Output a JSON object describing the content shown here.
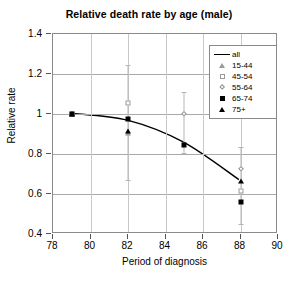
{
  "chart_data": {
    "type": "scatter",
    "title": "Relative death rate by age (male)",
    "xlabel": "Period of diagnosis",
    "ylabel": "Relative rate",
    "xlim": [
      78,
      90
    ],
    "ylim": [
      0.4,
      1.4
    ],
    "xticks": [
      "78",
      "80",
      "82",
      "84",
      "86",
      "88",
      "90"
    ],
    "xtick_values": [
      78,
      80,
      82,
      84,
      86,
      88,
      90
    ],
    "yticks": [
      "0.4",
      "0.6",
      "0.8",
      "1",
      "1.2",
      "1.4"
    ],
    "ytick_values": [
      0.4,
      0.6,
      0.8,
      1.0,
      1.2,
      1.4
    ],
    "grid": "horizontal",
    "legend_position": "top-right",
    "x": [
      79,
      82,
      85,
      88
    ],
    "series": [
      {
        "name": "all",
        "marker": "line",
        "values": [
          1.0,
          0.965,
          0.855,
          0.665
        ]
      },
      {
        "name": "15-44",
        "marker": "triangle-open",
        "values": [
          1.0,
          0.905,
          null,
          null
        ]
      },
      {
        "name": "45-54",
        "marker": "square-open",
        "values": [
          1.0,
          1.053,
          null,
          0.615
        ]
      },
      {
        "name": "55-64",
        "marker": "diamond-open",
        "values": [
          1.0,
          null,
          0.998,
          0.723
        ]
      },
      {
        "name": "65-74",
        "marker": "square-filled",
        "values": [
          1.0,
          0.975,
          0.845,
          0.56
        ]
      },
      {
        "name": "75+",
        "marker": "triangle-filled",
        "values": [
          1.0,
          0.915,
          null,
          0.667
        ]
      }
    ],
    "error_bars": [
      {
        "x": 82,
        "low": 0.668,
        "high": 1.243
      },
      {
        "x": 85,
        "low": 0.803,
        "high": 1.112
      },
      {
        "x": 88,
        "low": 0.452,
        "high": 0.833
      }
    ]
  },
  "legend": {
    "items": [
      {
        "label": "all",
        "key": "line-key"
      },
      {
        "label": "15-44",
        "key": "triangle-open-key"
      },
      {
        "label": "45-54",
        "key": "square-open-key"
      },
      {
        "label": "55-64",
        "key": "diamond-open-key"
      },
      {
        "label": "65-74",
        "key": "square-filled-key"
      },
      {
        "label": "75+",
        "key": "triangle-filled-key"
      }
    ]
  },
  "colors": {
    "line": "#000000",
    "grid": "#a9a9a9",
    "frame": "#8a8a8a",
    "open_marker": "#9a9a9a",
    "error_bar": "#b5b5b5",
    "background": "#ffffff"
  }
}
